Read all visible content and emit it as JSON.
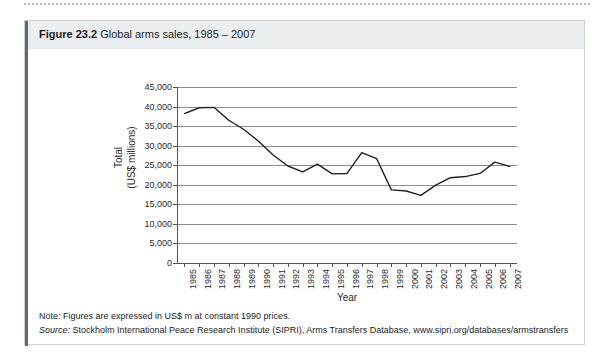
{
  "figure": {
    "label": "Figure 23.2",
    "title": "Global arms sales, 1985 – 2007"
  },
  "notes": {
    "note_text": "Note: Figures are expressed in US$ m at constant 1990 prices.",
    "source_label": "Source:",
    "source_text": " Stockholm International Peace Research Institute (SIPRI), Arms Transfers Database, www.sipri.org/databases/armstransfers"
  },
  "chart_data": {
    "type": "line",
    "title": "Global arms sales, 1985 – 2007",
    "xlabel": "Year",
    "ylabel": "Total\n(US$ millions)",
    "ylabel_line1": "Total",
    "ylabel_line2": "(US$ millions)",
    "ylim": [
      0,
      45000
    ],
    "ytick_labels": [
      "45,000",
      "40,000",
      "35,000",
      "30,000",
      "25,000",
      "20,000",
      "15,000",
      "10,000",
      "5,000",
      "0"
    ],
    "ytick_values": [
      45000,
      40000,
      35000,
      30000,
      25000,
      20000,
      15000,
      10000,
      5000,
      0
    ],
    "grid": true,
    "legend": "none",
    "line_color": "#231f20",
    "categories": [
      "1985",
      "1986",
      "1987",
      "1988",
      "1989",
      "1990",
      "1991",
      "1992",
      "1993",
      "1994",
      "1995",
      "1996",
      "1997",
      "1998",
      "1999",
      "2000",
      "2001",
      "2002",
      "2003",
      "2004",
      "2005",
      "2006",
      "2007"
    ],
    "values": [
      38200,
      39700,
      39800,
      36500,
      34200,
      31200,
      27600,
      24800,
      23300,
      25300,
      22800,
      22900,
      28200,
      26700,
      18700,
      18400,
      17300,
      19900,
      21800,
      22100,
      22900,
      25800,
      24700
    ]
  }
}
